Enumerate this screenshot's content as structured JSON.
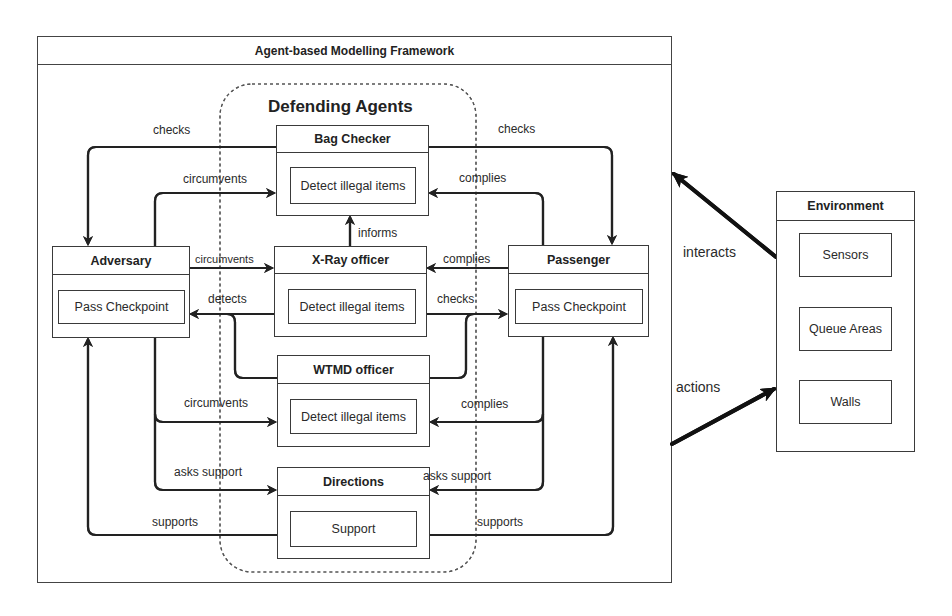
{
  "framework": {
    "title": "Agent-based Modelling Framework"
  },
  "defending_group": {
    "title": "Defending Agents"
  },
  "agents": {
    "bag_checker": {
      "name": "Bag Checker",
      "behavior": "Detect illegal items"
    },
    "xray_officer": {
      "name": "X-Ray officer",
      "behavior": "Detect illegal items"
    },
    "wtmd_officer": {
      "name": "WTMD officer",
      "behavior": "Detect illegal items"
    },
    "directions": {
      "name": "Directions",
      "behavior": "Support"
    },
    "adversary": {
      "name": "Adversary",
      "behavior": "Pass Checkpoint"
    },
    "passenger": {
      "name": "Passenger",
      "behavior": "Pass Checkpoint"
    }
  },
  "environment": {
    "title": "Environment",
    "items": [
      "Sensors",
      "Queue Areas",
      "Walls"
    ]
  },
  "edges": {
    "checks_left": "checks",
    "checks_right": "checks",
    "circumvents_bag": "circumvents",
    "complies_bag": "complies",
    "informs": "informs",
    "circumvents_xray": "circumvents",
    "complies_xray": "complies",
    "detects": "detects",
    "checks_passenger": "checks",
    "circumvents_wtmd": "circumvents",
    "complies_wtmd": "complies",
    "asks_support_left": "asks support",
    "asks_support_right": "asks support",
    "supports_left": "supports",
    "supports_right": "supports",
    "interacts": "interacts",
    "actions": "actions"
  },
  "colors": {
    "line": "#222222",
    "box_border": "#3a3a3a",
    "background": "#ffffff"
  }
}
